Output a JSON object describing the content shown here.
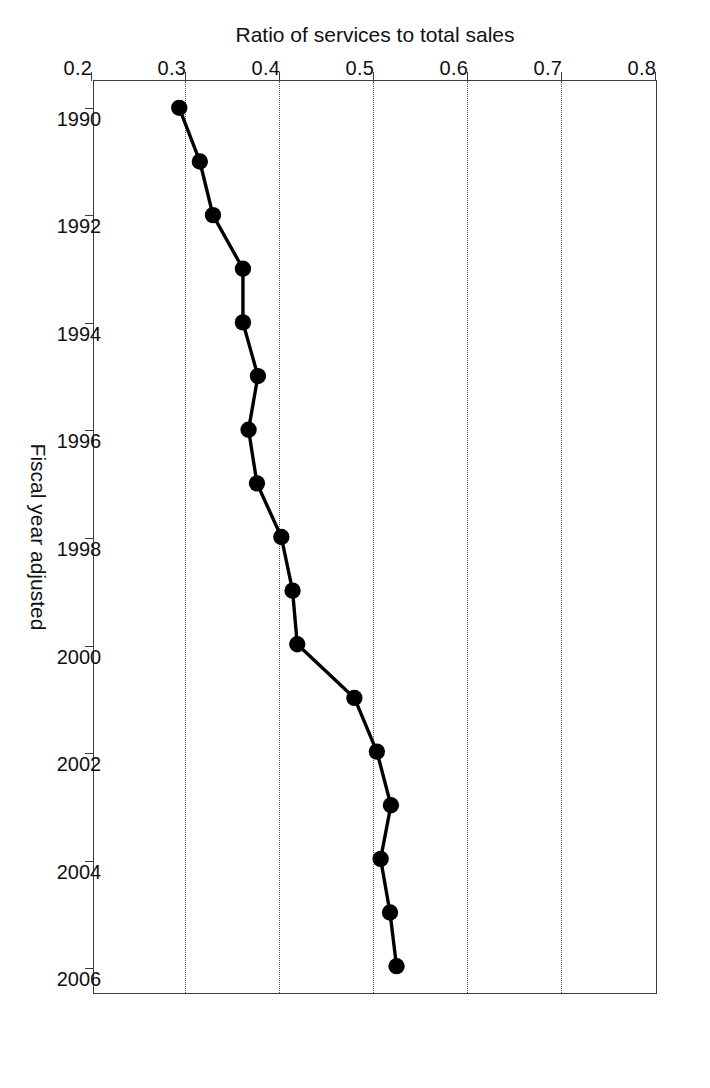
{
  "chart_data": {
    "type": "line",
    "title": "",
    "xlabel": "Fiscal year adjusted",
    "ylabel": "Ratio of services to total sales",
    "x": [
      1990,
      1991,
      1992,
      1993,
      1994,
      1995,
      1996,
      1997,
      1998,
      1999,
      2000,
      2001,
      2002,
      2003,
      2004,
      2005,
      2006
    ],
    "values": [
      0.291,
      0.313,
      0.327,
      0.359,
      0.359,
      0.375,
      0.365,
      0.374,
      0.4,
      0.412,
      0.417,
      0.478,
      0.502,
      0.517,
      0.506,
      0.516,
      0.523
    ],
    "series": [
      {
        "name": "Ratio of services to total sales",
        "values": [
          0.291,
          0.313,
          0.327,
          0.359,
          0.359,
          0.375,
          0.365,
          0.374,
          0.4,
          0.412,
          0.417,
          0.478,
          0.502,
          0.517,
          0.506,
          0.516,
          0.523
        ]
      }
    ],
    "xlim": [
      1989.5,
      2006.5
    ],
    "ylim": [
      0.2,
      0.8
    ],
    "xticks": [
      1990,
      1992,
      1994,
      1996,
      1998,
      2000,
      2002,
      2004,
      2006
    ],
    "xticklabels": [
      "1990",
      "1992",
      "1994",
      "1996",
      "1998",
      "2000",
      "2002",
      "2004",
      "2006"
    ],
    "yticks": [
      0.2,
      0.3,
      0.4,
      0.5,
      0.6,
      0.7,
      0.8
    ],
    "yticklabels": [
      "0.2",
      "0.3",
      "0.4",
      "0.5",
      "0.6",
      "0.7",
      "0.8"
    ],
    "grid": "horizontal-dotted",
    "legend": null,
    "marker": "filled-circle",
    "line_color": "#000000",
    "marker_color": "#000000",
    "grid_color": "#555555",
    "axis_color": "#3a3a3a",
    "background": "#ffffff",
    "orientation": "rotated-90-clockwise"
  }
}
